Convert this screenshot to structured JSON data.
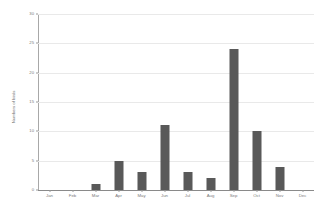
{
  "chart_data": {
    "type": "bar",
    "title": "",
    "subtitle": "",
    "xlabel": "",
    "ylabel": "Numbers of birds",
    "categories": [
      "Jan",
      "Feb",
      "Mar",
      "Apr",
      "May",
      "Jun",
      "Jul",
      "Aug",
      "Sep",
      "Oct",
      "Nov",
      "Dec"
    ],
    "values": [
      0,
      0,
      1,
      5,
      3,
      11,
      3,
      2,
      24,
      10,
      4,
      0
    ],
    "series": [
      {
        "name": "Numbers of birds",
        "values": [
          0,
          0,
          1,
          5,
          3,
          11,
          3,
          2,
          24,
          10,
          4,
          0
        ]
      }
    ],
    "ylim": [
      0,
      30
    ],
    "xlim_categories": 12,
    "yticks": [
      0,
      5,
      10,
      15,
      20,
      25,
      30
    ],
    "ytick_labels": [
      "0",
      "5",
      "10",
      "15",
      "20",
      "25",
      "30"
    ],
    "grid": true,
    "grid_axis": "y",
    "legend": false,
    "legend_position": "none",
    "bar_color": "#595959",
    "grid_color": "#e9e9e9",
    "axis_color": "#8a8a8a",
    "text_color": "#7a7a7a",
    "background_color": "#ffffff"
  }
}
